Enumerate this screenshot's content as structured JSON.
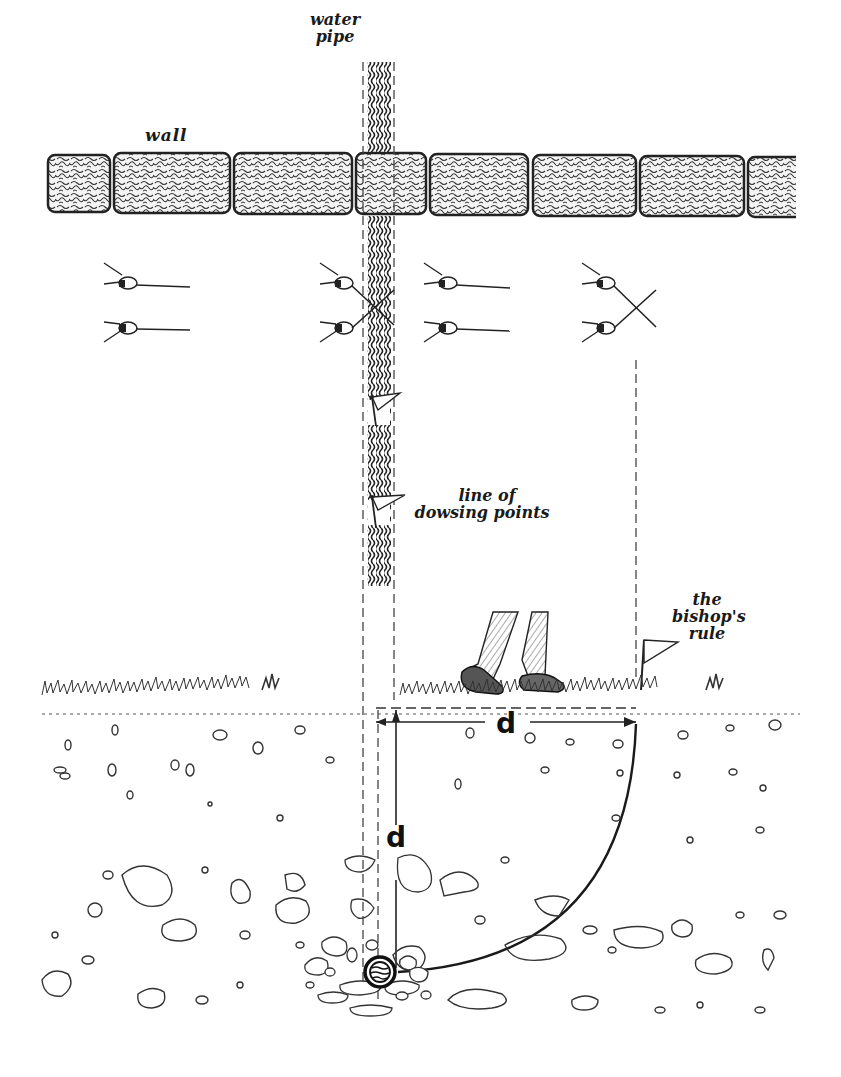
{
  "diagram": {
    "type": "illustrated-explanatory-diagram",
    "colors": {
      "ink": "#1a1a1a",
      "background": "#ffffff",
      "stone_fill": "#f4f4f4"
    },
    "labels": {
      "wall": "wall",
      "water_pipe_line1": "water",
      "water_pipe_line2": "pipe",
      "dowsing_line1": "line of",
      "dowsing_line2": "dowsing points",
      "bishops_line1": "the",
      "bishops_line2": "bishop's",
      "bishops_line3": "rule",
      "horizontal_distance": "d",
      "vertical_depth": "d"
    },
    "elements": {
      "wall_blocks": 7,
      "dowsing_rod_stations": [
        {
          "position": "left of pipe",
          "rods": "parallel"
        },
        {
          "position": "over pipe",
          "rods": "crossed"
        },
        {
          "position": "right of pipe",
          "rods": "parallel"
        },
        {
          "position": "far right",
          "rods": "crossed"
        }
      ],
      "marker_flags_on_pipe_line": 2,
      "bishops_rule_flag": 1,
      "walker": "legs of person walking away from pipe line"
    },
    "relationships": [
      "Rods cross when the dowser is directly over the water pipe",
      "Line of dowsing points marks the pipe's surface route",
      "Distance d walked from the pipe line to the second crossing equals the pipe depth d"
    ]
  }
}
